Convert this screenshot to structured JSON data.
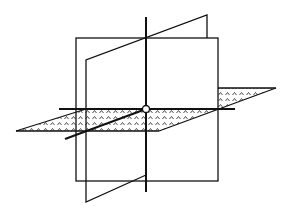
{
  "diagram": {
    "title": "",
    "colors": {
      "stroke": "#111111",
      "background": "#ffffff",
      "fill": "#ffffff"
    },
    "planes": [
      {
        "name": "back-vertical-plane",
        "shaded": false
      },
      {
        "name": "slanted-vertical-plane",
        "shaded": false
      },
      {
        "name": "horizontal-plane",
        "shaded": true,
        "pattern": "caret-dots"
      }
    ],
    "axes": [
      {
        "name": "vertical-axis"
      },
      {
        "name": "horizontal-axis"
      },
      {
        "name": "diagonal-axis"
      }
    ],
    "origin": {
      "name": "origin-point",
      "marker": "circle"
    }
  }
}
